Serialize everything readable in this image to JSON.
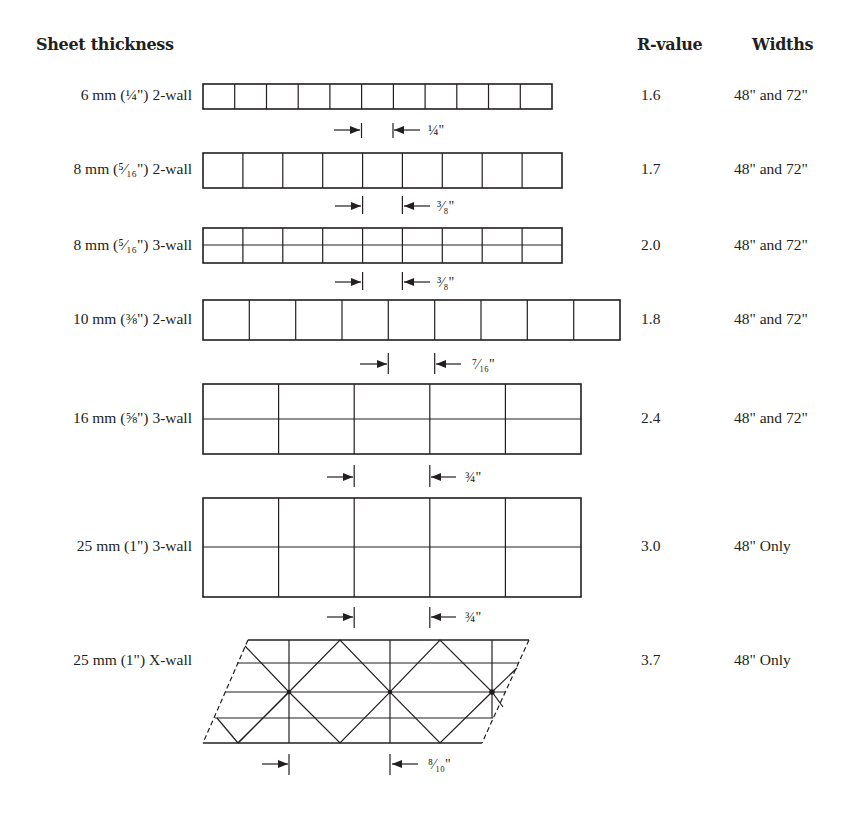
{
  "headers": {
    "thickness": "Sheet thickness",
    "rvalue": "R-value",
    "widths": "Widths"
  },
  "rows": [
    {
      "name": "6 mm (¼\") 2-wall",
      "rvalue": "1.6",
      "widths": "48\" and 72\"",
      "structure": "2-wall",
      "cells": 11,
      "spacing": "¼\""
    },
    {
      "name": "8 mm (⁵⁄₁₆\") 2-wall",
      "rvalue": "1.7",
      "widths": "48\" and 72\"",
      "structure": "2-wall",
      "cells": 9,
      "spacing": "³⁄₈\""
    },
    {
      "name": "8 mm (⁵⁄₁₆\") 3-wall",
      "rvalue": "2.0",
      "widths": "48\" and 72\"",
      "structure": "3-wall",
      "cells": 9,
      "spacing": "³⁄₈\""
    },
    {
      "name": "10 mm (⅜\") 2-wall",
      "rvalue": "1.8",
      "widths": "48\" and 72\"",
      "structure": "2-wall",
      "cells": 9,
      "spacing": "⁷⁄₁₆\""
    },
    {
      "name": "16 mm (⅝\") 3-wall",
      "rvalue": "2.4",
      "widths": "48\" and 72\"",
      "structure": "3-wall",
      "cells": 5,
      "spacing": "¾\""
    },
    {
      "name": "25 mm (1\") 3-wall",
      "rvalue": "3.0",
      "widths": "48\" Only",
      "structure": "3-wall",
      "cells": 5,
      "spacing": "¾\""
    },
    {
      "name": "25 mm (1\") X-wall",
      "rvalue": "3.7",
      "widths": "48\" Only",
      "structure": "X-wall",
      "cells": 3,
      "spacing": "⁸⁄₁₀\""
    }
  ],
  "colors": {
    "ink": "#231f20",
    "background": "#ffffff"
  }
}
